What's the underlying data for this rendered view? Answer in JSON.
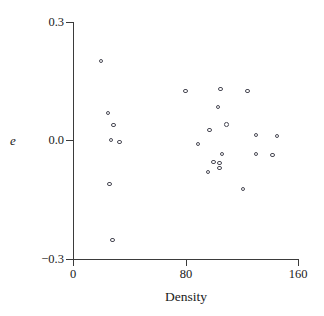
{
  "figure": {
    "background_color": "#ffffff",
    "axis_color": "#3b3b3b",
    "marker_color": "#4a4a55"
  },
  "axes": {
    "xlabel": "Density",
    "ylabel": "e",
    "x_ticks": [
      {
        "label": "0",
        "value": 0
      },
      {
        "label": "80",
        "value": 80
      },
      {
        "label": "160",
        "value": 160
      }
    ],
    "y_ticks": [
      {
        "label": "0.3",
        "value": 0.3
      },
      {
        "label": "0.0",
        "value": 0.0
      },
      {
        "label": "−0.3",
        "value": -0.3
      }
    ]
  },
  "chart_data": {
    "type": "scatter",
    "title": "",
    "subtitle": "",
    "xlabel": "Density",
    "ylabel": "e",
    "xlim": [
      0,
      160
    ],
    "ylim": [
      -0.3,
      0.3
    ],
    "xticks": [
      0,
      80,
      160
    ],
    "yticks": [
      -0.3,
      0.0,
      0.3
    ],
    "grid": false,
    "legend": null,
    "marker": "open-circle",
    "series": [
      {
        "name": "residuals",
        "points": [
          {
            "x": 20,
            "y": 0.201
          },
          {
            "x": 25,
            "y": 0.07
          },
          {
            "x": 29,
            "y": 0.039
          },
          {
            "x": 27,
            "y": 0.001
          },
          {
            "x": 33,
            "y": -0.004
          },
          {
            "x": 26,
            "y": -0.11
          },
          {
            "x": 28,
            "y": -0.252
          },
          {
            "x": 80,
            "y": 0.125
          },
          {
            "x": 89,
            "y": -0.009
          },
          {
            "x": 97,
            "y": 0.027
          },
          {
            "x": 103,
            "y": 0.085
          },
          {
            "x": 105,
            "y": 0.13
          },
          {
            "x": 109,
            "y": 0.04
          },
          {
            "x": 106,
            "y": -0.034
          },
          {
            "x": 104,
            "y": -0.057
          },
          {
            "x": 104,
            "y": -0.07
          },
          {
            "x": 100,
            "y": -0.054
          },
          {
            "x": 96,
            "y": -0.08
          },
          {
            "x": 121,
            "y": -0.123
          },
          {
            "x": 124,
            "y": 0.125
          },
          {
            "x": 130,
            "y": 0.014
          },
          {
            "x": 130,
            "y": -0.034
          },
          {
            "x": 145,
            "y": 0.011
          },
          {
            "x": 142,
            "y": -0.037
          }
        ]
      }
    ]
  },
  "markers_px": [
    {
      "left": 101,
      "top": 61
    },
    {
      "left": 108,
      "top": 113
    },
    {
      "left": 114,
      "top": 125
    },
    {
      "left": 111,
      "top": 140
    },
    {
      "left": 119,
      "top": 142
    },
    {
      "left": 110,
      "top": 184
    },
    {
      "left": 113,
      "top": 240
    },
    {
      "left": 186,
      "top": 91
    },
    {
      "left": 198,
      "top": 144
    },
    {
      "left": 209,
      "top": 130
    },
    {
      "left": 218,
      "top": 107
    },
    {
      "left": 221,
      "top": 89
    },
    {
      "left": 226,
      "top": 124
    },
    {
      "left": 222,
      "top": 154
    },
    {
      "left": 213,
      "top": 162
    },
    {
      "left": 220,
      "top": 163
    },
    {
      "left": 220,
      "top": 169
    },
    {
      "left": 208,
      "top": 172
    },
    {
      "left": 243,
      "top": 189
    },
    {
      "left": 248,
      "top": 90
    },
    {
      "left": 255,
      "top": 135
    },
    {
      "left": 256,
      "top": 155
    },
    {
      "left": 277,
      "top": 136
    },
    {
      "left": 273,
      "top": 155
    }
  ],
  "tick_px": {
    "y": [
      {
        "top": 22,
        "label_top": 16
      },
      {
        "top": 140,
        "label_top": 134
      },
      {
        "top": 259,
        "label_top": 253
      }
    ],
    "x": [
      {
        "left": 73,
        "label_left": 53
      },
      {
        "left": 186,
        "label_left": 166
      },
      {
        "left": 298,
        "label_left": 278
      }
    ]
  }
}
